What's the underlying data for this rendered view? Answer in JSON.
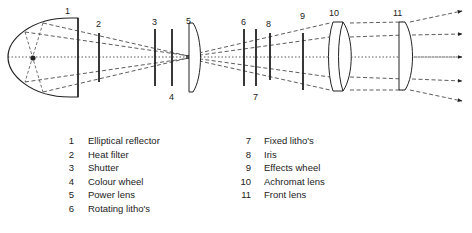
{
  "diagram": {
    "callouts": [
      {
        "num": "1",
        "x": 65,
        "y": 14
      },
      {
        "num": "2",
        "x": 96,
        "y": 27
      },
      {
        "num": "3",
        "x": 152,
        "y": 25
      },
      {
        "num": "4",
        "x": 169,
        "y": 100
      },
      {
        "num": "5",
        "x": 186,
        "y": 24
      },
      {
        "num": "6",
        "x": 241,
        "y": 25
      },
      {
        "num": "7",
        "x": 253,
        "y": 100
      },
      {
        "num": "8",
        "x": 266,
        "y": 27
      },
      {
        "num": "9",
        "x": 300,
        "y": 19
      },
      {
        "num": "10",
        "x": 329,
        "y": 16
      },
      {
        "num": "11",
        "x": 393,
        "y": 16
      }
    ]
  },
  "legend": {
    "left": [
      {
        "num": "1",
        "label": "Elliptical reflector"
      },
      {
        "num": "2",
        "label": "Heat filter"
      },
      {
        "num": "3",
        "label": "Shutter"
      },
      {
        "num": "4",
        "label": "Colour wheel"
      },
      {
        "num": "5",
        "label": "Power lens"
      },
      {
        "num": "6",
        "label": "Rotating litho's"
      }
    ],
    "right": [
      {
        "num": "7",
        "label": "Fixed litho's"
      },
      {
        "num": "8",
        "label": "Iris"
      },
      {
        "num": "9",
        "label": "Effects wheel"
      },
      {
        "num": "10",
        "label": "Achromat lens"
      },
      {
        "num": "11",
        "label": "Front lens"
      }
    ]
  },
  "colors": {
    "line": "#222222",
    "background": "#ffffff"
  }
}
